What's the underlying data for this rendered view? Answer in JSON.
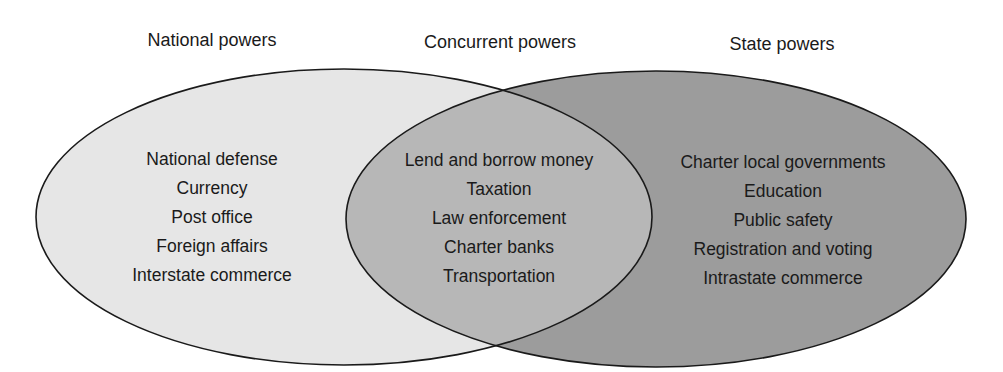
{
  "diagram": {
    "type": "venn",
    "colors": {
      "national_fill": "#e6e6e6",
      "state_fill": "#9c9c9c",
      "overlap_fill": "#b7b7b7",
      "stroke": "#1a1a1a",
      "text": "#1a1a1a"
    },
    "national": {
      "title": "National powers",
      "items": [
        "National defense",
        "Currency",
        "Post office",
        "Foreign affairs",
        "Interstate commerce"
      ]
    },
    "concurrent": {
      "title": "Concurrent powers",
      "items": [
        "Lend and borrow money",
        "Taxation",
        "Law enforcement",
        "Charter banks",
        "Transportation"
      ]
    },
    "state": {
      "title": "State powers",
      "items": [
        "Charter local governments",
        "Education",
        "Public safety",
        "Registration and voting",
        "Intrastate commerce"
      ]
    }
  }
}
